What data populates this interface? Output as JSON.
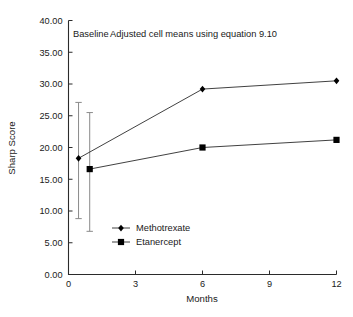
{
  "chart_data": {
    "type": "line",
    "title": "",
    "xlabel": "Months",
    "ylabel": "Sharp Score",
    "xlim": [
      0,
      12
    ],
    "ylim": [
      0,
      40
    ],
    "grid": false,
    "legend_position": "inside-lower-left",
    "x_ticks": [
      "0",
      "3",
      "6",
      "9",
      "12"
    ],
    "x_tick_values": [
      0,
      3,
      6,
      9,
      12
    ],
    "y_ticks": [
      "0.00",
      "5.00",
      "10.00",
      "15.00",
      "20.00",
      "25.00",
      "30.00",
      "35.00",
      "40.00"
    ],
    "y_tick_values": [
      0,
      5,
      10,
      15,
      20,
      25,
      30,
      35,
      40
    ],
    "annotations": [
      {
        "text": "Baseline",
        "x": 1.0,
        "y": 37.4
      },
      {
        "text": "Adjusted cell means using equation 9.10",
        "x": 5.6,
        "y": 37.4
      }
    ],
    "series": [
      {
        "name": "Methotrexate",
        "marker": "diamond",
        "x": [
          0.45,
          6,
          12
        ],
        "values": [
          18.3,
          29.2,
          30.5
        ],
        "error_bar": {
          "x": 0.45,
          "low": 8.8,
          "high": 27.1
        }
      },
      {
        "name": "Etanercept",
        "marker": "square",
        "x": [
          0.95,
          6,
          12
        ],
        "values": [
          16.6,
          20.0,
          21.2
        ],
        "error_bar": {
          "x": 0.95,
          "low": 6.8,
          "high": 25.5
        }
      }
    ]
  },
  "colors": {
    "axis": "#2b2b2b",
    "series_line": "#2b2b2b",
    "marker": "#000000",
    "error_bar": "#8a8a8a",
    "background": "#ffffff"
  }
}
